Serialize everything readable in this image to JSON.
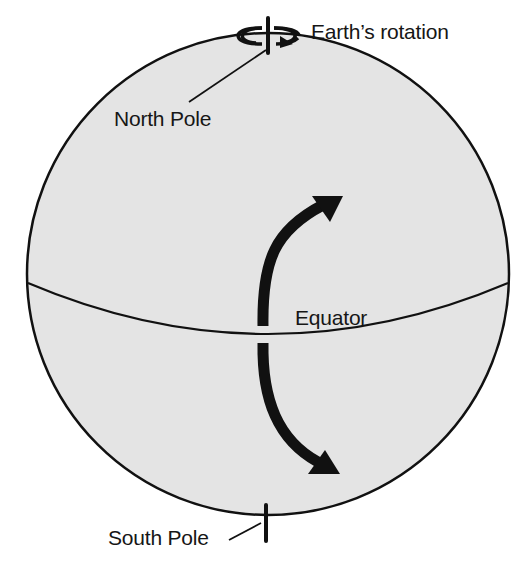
{
  "diagram": {
    "labels": {
      "rotation": "Earth’s rotation",
      "north_pole": "North Pole",
      "equator": "Equator",
      "south_pole": "South Pole"
    },
    "elements": {
      "sphere": "globe",
      "axis": "rotation-axis",
      "equator_line": "equator",
      "arrows": [
        {
          "name": "northern-deflection-arrow",
          "direction": "curving up and to the right"
        },
        {
          "name": "southern-deflection-arrow",
          "direction": "curving down and to the right"
        }
      ],
      "rotation_indicator": "counter-clockwise loop arrow around north axis"
    },
    "colors": {
      "sphere_fill": "#e4e4e4",
      "stroke": "#111111",
      "background": "#ffffff"
    }
  }
}
